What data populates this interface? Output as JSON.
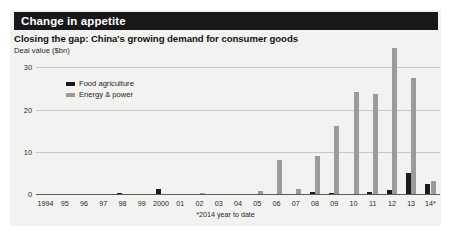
{
  "banner": {
    "title": "Change in appetite"
  },
  "subtitle": "Closing the gap: China's growing demand for consumer goods",
  "unit_label": "Deal value ($bn)",
  "footnote": "*2014 year to date",
  "legend": {
    "items": [
      {
        "label": "Food  agriculture",
        "color": "#1b1b1b",
        "key": "food"
      },
      {
        "label": "Energy & power",
        "color": "#9b9b99",
        "key": "energy"
      }
    ]
  },
  "chart_data": {
    "type": "bar",
    "title": "Closing the gap: China's growing demand for consumer goods",
    "subtitle": "Change in appetite",
    "xlabel": "",
    "ylabel": "Deal value ($bn)",
    "ylim": [
      0,
      32
    ],
    "yticks": [
      0,
      10,
      20,
      30
    ],
    "ytick_labels": [
      "0",
      "10",
      "20",
      "30"
    ],
    "grid": true,
    "legend_position": "upper-left-inside",
    "annotation": "*2014 year to date",
    "categories": [
      "1994",
      "95",
      "96",
      "97",
      "98",
      "99",
      "2000",
      "01",
      "02",
      "03",
      "04",
      "05",
      "06",
      "07",
      "08",
      "09",
      "10",
      "11",
      "12",
      "13",
      "14*"
    ],
    "series": [
      {
        "name": "Food  agriculture",
        "color": "#1b1b1b",
        "values": [
          0,
          0,
          0,
          0.2,
          0.5,
          0,
          1.4,
          0.2,
          0.3,
          0,
          0.3,
          0.2,
          0.1,
          0.1,
          0.6,
          0.5,
          0,
          0.7,
          1.3,
          5.2,
          2.6
        ]
      },
      {
        "name": "Energy & power",
        "color": "#9b9b99",
        "values": [
          0,
          0,
          0,
          0,
          0,
          0,
          0,
          0,
          0.5,
          0.2,
          0.1,
          1.0,
          8.3,
          1.5,
          9.2,
          16.3,
          24.5,
          24.0,
          34.8,
          27.8,
          3.3
        ]
      }
    ]
  }
}
